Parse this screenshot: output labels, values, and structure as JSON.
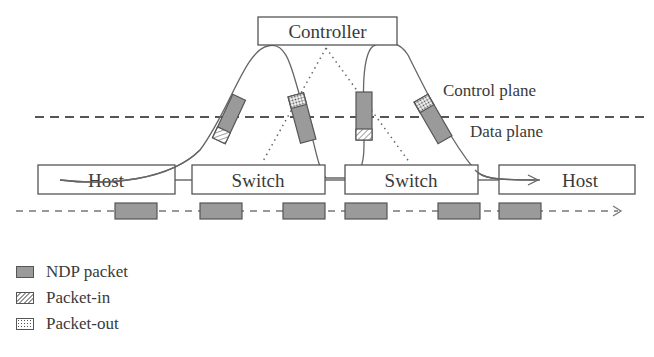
{
  "diagram": {
    "controller": {
      "label": "Controller"
    },
    "planes": {
      "control_label": "Control plane",
      "data_label": "Data plane"
    },
    "nodes": [
      {
        "id": "host-left",
        "label": "Host"
      },
      {
        "id": "switch-1",
        "label": "Switch"
      },
      {
        "id": "switch-2",
        "label": "Switch"
      },
      {
        "id": "host-right",
        "label": "Host"
      }
    ],
    "ndp_packet_row_count": 6,
    "colors": {
      "stroke": "#555555",
      "ndp_fill": "#9a9a9a",
      "text": "#3a3a3a"
    }
  },
  "legend": {
    "items": [
      {
        "swatch": "ndp",
        "label": "NDP packet"
      },
      {
        "swatch": "packet-in",
        "label": "Packet-in"
      },
      {
        "swatch": "packet-out",
        "label": "Packet-out"
      }
    ]
  }
}
